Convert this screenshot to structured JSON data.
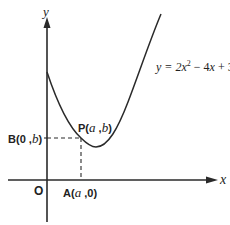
{
  "diagram": {
    "axes": {
      "x_label": "x",
      "y_label": "y",
      "origin_label": "O"
    },
    "curve": {
      "equation_parts": {
        "lhs": "y = 2",
        "var1": "x",
        "exp": "2",
        "mid": " − 4",
        "var2": "x",
        "rhs": " + 3"
      },
      "equation": "y = 2x^2 − 4x + 3"
    },
    "points": {
      "P": {
        "name": "P",
        "open": "(",
        "a": "a",
        "comma": " ,",
        "b": "b",
        "close": ")"
      },
      "A": {
        "name": "A",
        "open": "(",
        "a": "a",
        "comma": " ,",
        "zero": "0",
        "close": ")"
      },
      "B": {
        "name": "B",
        "open": "(",
        "zero": "0",
        "comma": " ,",
        "b": "b",
        "close": ")"
      }
    },
    "colors": {
      "line": "#2a2a2a",
      "text": "#222222",
      "background": "#ffffff"
    }
  }
}
